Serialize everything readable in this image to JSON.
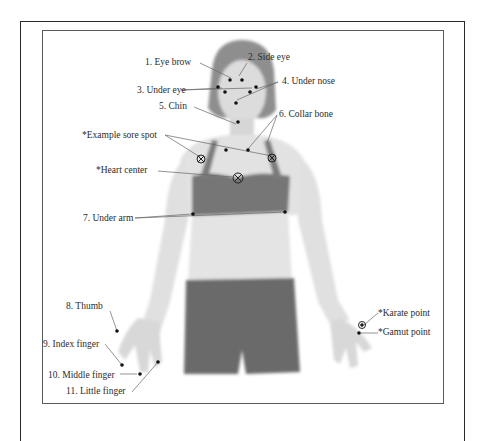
{
  "diagram": {
    "title": "",
    "points": [
      {
        "id": "eye-brow",
        "label": "1. Eye brow"
      },
      {
        "id": "side-eye",
        "label": "2. Side eye"
      },
      {
        "id": "under-eye",
        "label": "3. Under eye"
      },
      {
        "id": "under-nose",
        "label": "4. Under nose"
      },
      {
        "id": "chin",
        "label": "5. Chin"
      },
      {
        "id": "collar-bone",
        "label": "6. Collar bone"
      },
      {
        "id": "example-sore-spot",
        "label": "*Example sore spot"
      },
      {
        "id": "heart-center",
        "label": "*Heart center"
      },
      {
        "id": "under-arm",
        "label": "7. Under arm"
      },
      {
        "id": "thumb",
        "label": "8. Thumb"
      },
      {
        "id": "index-finger",
        "label": "9. Index finger"
      },
      {
        "id": "middle-finger",
        "label": "10. Middle finger"
      },
      {
        "id": "little-finger",
        "label": "11. Little finger"
      },
      {
        "id": "karate-point",
        "label": "*Karate point"
      },
      {
        "id": "gamut-point",
        "label": "*Gamut point"
      }
    ],
    "colors": {
      "line": "#555555",
      "dot": "#111111",
      "skin": "#e4e4e4",
      "clothing": "#6e6e6e",
      "hair": "#8a8a8a"
    }
  }
}
